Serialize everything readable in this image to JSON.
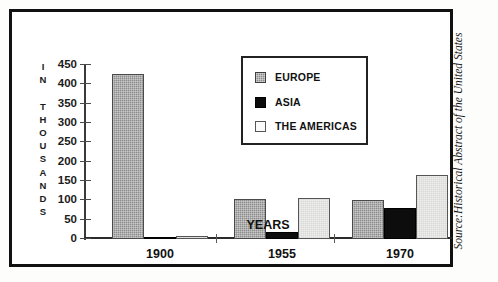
{
  "figure": {
    "source_note": "Source:Historical Abstract of the United States"
  },
  "axes": {
    "ylabel_text": "I\nN\n\nT\nH\nO\nU\nS\nA\nN\nD\nS",
    "xlabel": "YEARS"
  },
  "legend": {
    "items": [
      {
        "label": "EUROPE",
        "swatch": "europe-swatch",
        "color": "#8d8d8d"
      },
      {
        "label": "ASIA",
        "swatch": "asia-swatch",
        "color": "#0d0d0d"
      },
      {
        "label": "THE AMERICAS",
        "swatch": "americas-swatch",
        "color": "#eeeeec"
      }
    ]
  },
  "chart_data": {
    "type": "bar",
    "title": "",
    "subtitle": "",
    "xlabel": "YEARS",
    "ylabel": "IN THOUSANDS",
    "categories": [
      "1900",
      "1955",
      "1970"
    ],
    "series": [
      {
        "name": "EUROPE",
        "values": [
          428,
          104,
          100
        ],
        "color": "#8d8d8d"
      },
      {
        "name": "ASIA",
        "values": [
          4,
          17,
          80
        ],
        "color": "#0d0d0d"
      },
      {
        "name": "THE AMERICAS",
        "values": [
          9,
          105,
          165
        ],
        "color": "#eeeeec"
      }
    ],
    "ylim": [
      0,
      450
    ],
    "yticks": [
      0,
      50,
      100,
      150,
      200,
      250,
      300,
      350,
      400,
      450
    ],
    "ytick_labels": [
      "0",
      "50",
      "100",
      "150",
      "200",
      "250",
      "300",
      "350",
      "400",
      "450"
    ],
    "grid": false,
    "legend_position": "upper center"
  }
}
